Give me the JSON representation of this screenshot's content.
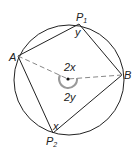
{
  "diagram": {
    "points": {
      "A": {
        "label": "A"
      },
      "B": {
        "label": "B"
      },
      "P1": {
        "label": "P",
        "subscript": "1"
      },
      "P2": {
        "label": "P",
        "subscript": "2"
      }
    },
    "angles": {
      "at_P1": "y",
      "at_P2": "x",
      "center_upper": "2x",
      "center_lower": "2y"
    },
    "colors": {
      "stroke": "#222222",
      "arc": "#999999",
      "dash": "#888888"
    }
  }
}
